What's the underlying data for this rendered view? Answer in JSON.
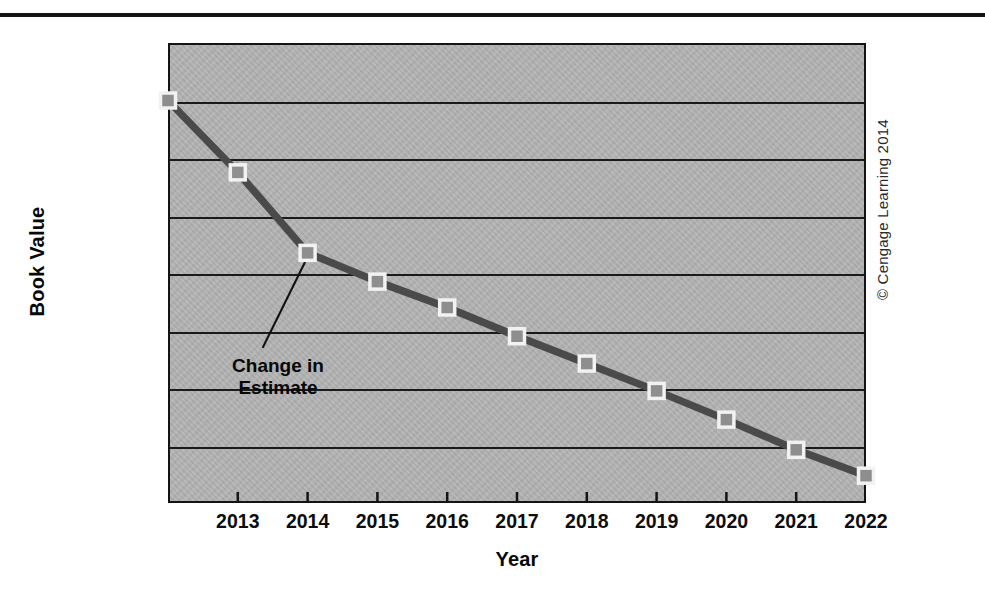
{
  "figure": {
    "credit": "© Cengage Learning 2014",
    "top_rule": "horizontal-rule"
  },
  "chart_data": {
    "type": "line",
    "title": "",
    "xlabel": "Year",
    "ylabel": "Book Value",
    "x": [
      2012,
      2013,
      2014,
      2015,
      2016,
      2017,
      2018,
      2019,
      2020,
      2021,
      2022
    ],
    "categories": [
      "",
      "2013",
      "2014",
      "2015",
      "2016",
      "2017",
      "2018",
      "2019",
      "2020",
      "2021",
      "2022"
    ],
    "values": [
      140000,
      115000,
      87000,
      77000,
      68000,
      58000,
      48500,
      39000,
      29000,
      18500,
      9500
    ],
    "series": [
      {
        "name": "Book Value",
        "values": [
          140000,
          115000,
          87000,
          77000,
          68000,
          58000,
          48500,
          39000,
          29000,
          18500,
          9500
        ]
      }
    ],
    "ylim": [
      0,
      160000
    ],
    "xlim": [
      2012,
      2022
    ],
    "ytick_values": [
      0,
      20000,
      40000,
      60000,
      80000,
      100000,
      120000,
      140000,
      160000
    ],
    "ytick_labels": [
      "0",
      "20,000",
      "40,000",
      "60,000",
      "80,000",
      "100,000",
      "120,000",
      "140,000",
      "$160,000"
    ],
    "xtick_labels": [
      "2013",
      "2014",
      "2015",
      "2016",
      "2017",
      "2018",
      "2019",
      "2020",
      "2021",
      "2022"
    ],
    "xtick_values": [
      2013,
      2014,
      2015,
      2016,
      2017,
      2018,
      2019,
      2020,
      2021,
      2022
    ],
    "grid": "horizontal",
    "legend": "none",
    "annotations": [
      {
        "text": "Change in\nEstimate",
        "points_to_x": 2014,
        "points_to_y": 87000
      }
    ],
    "colors": {
      "plot_background": "#b2b2b2",
      "line": "#4a4a4a",
      "marker_fill": "#8e8e8e",
      "marker_border": "#f2f2f2",
      "gridline": "#1a1a1a",
      "axis": "#141414",
      "text": "#0d0d0d",
      "page_background": "#ffffff"
    }
  }
}
